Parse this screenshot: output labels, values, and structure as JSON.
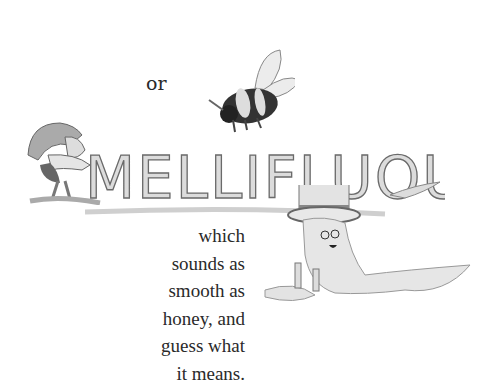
{
  "page": {
    "word_or": "or",
    "title_word": "MELLIFLUOUS",
    "body_lines": [
      "which",
      "sounds as",
      "smooth as",
      "honey, and",
      "guess what",
      "it means."
    ]
  },
  "illustrations": {
    "bee": "bee-illustration",
    "gnome": "gnome-illustration",
    "lettering": "dripping-honey-lettering",
    "honey_character": "honey-character-with-top-hat"
  },
  "colors": {
    "background": "#ffffff",
    "text": "#2a2a2a",
    "ink": "#555555",
    "light_fill": "#d9d9d9"
  }
}
